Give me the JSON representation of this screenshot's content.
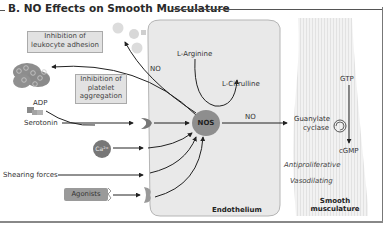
{
  "title": "B. NO Effects on Smooth Musculature",
  "colors": {
    "endothelium_fill": "#e9e9e9",
    "muscle_fill": "#efefef",
    "nos_fill": "#8e8e8e",
    "callout_fill": "#e2e2e2",
    "arrow": "#222222"
  },
  "callouts": {
    "leukocyte": [
      "Inhibition of",
      "leukocyte adhesion"
    ],
    "platelet": [
      "Inhibition of",
      "platelet",
      "aggregation"
    ]
  },
  "inputs": {
    "adp": "ADP",
    "serotonin": "Serotonin",
    "calcium": "Ca²⁺",
    "shearing": "Shearing forces",
    "agonists": "Agonists"
  },
  "endothelium": {
    "label": "Endothelium",
    "enzyme": "NOS",
    "substrate": "L-Arginine",
    "product": "L-Citrulline",
    "no_left": "NO",
    "no_right": "NO"
  },
  "smooth_muscle": {
    "label_line1": "Smooth",
    "label_line2": "musculature",
    "gtp": "GTP",
    "enzyme_line1": "Guanylate",
    "enzyme_line2": "cyclase",
    "cgmp": "cGMP",
    "effect1": "Antiproliferative",
    "effect2": "Vasodilating"
  }
}
